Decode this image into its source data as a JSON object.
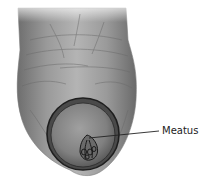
{
  "figure": {
    "labels": [
      {
        "text": "Meatus",
        "points_to": "urethral-opening"
      }
    ]
  },
  "colors": {
    "background": "#ffffff",
    "skin_light": "#a9a9a9",
    "skin_mid": "#8a8a8a",
    "skin_dark": "#5a5a5a",
    "outline": "#2a2a2a",
    "leader_line": "#222222"
  }
}
